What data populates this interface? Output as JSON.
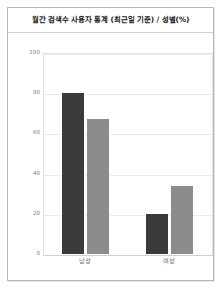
{
  "card": {
    "title": "월간 검색수 사용자 통계 (최근일 기준) / 성별(%)"
  },
  "chart_data": {
    "type": "bar",
    "title": "월간 검색수 사용자 통계 (최근일 기준) / 성별(%)",
    "xlabel": "",
    "ylabel": "",
    "categories": [
      "남성",
      "여성"
    ],
    "series": [
      {
        "name": "series-1",
        "color": "#3a3a3a",
        "values": [
          80,
          20
        ]
      },
      {
        "name": "series-2",
        "color": "#8c8c8c",
        "values": [
          67,
          34
        ]
      }
    ],
    "ylim": [
      0,
      100
    ],
    "yticks": [
      0,
      20,
      40,
      60,
      80,
      100
    ],
    "ytick_labels": [
      "0",
      "20",
      "40",
      "60",
      "80",
      "100"
    ],
    "grid": true,
    "legend": "none",
    "colors": {
      "bar_dark": "#3a3a3a",
      "bar_light": "#8c8c8c",
      "grid": "#ececec",
      "axis": "#cfcfcf",
      "tick_text": "#808080",
      "title_text": "#222222",
      "card_border": "#b8b8b8"
    }
  }
}
